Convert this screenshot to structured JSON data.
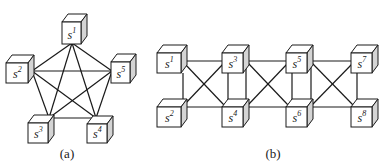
{
  "colors": {
    "stroke": "#1a1a1a",
    "side_face": "#d4d4d4",
    "background": "#ffffff"
  },
  "panels": [
    {
      "id": "a",
      "caption": "(a)",
      "caption_pos": [
        67,
        158
      ],
      "topology": "complete graph (K5)",
      "nodes": [
        {
          "id": "s1",
          "base": "s",
          "sup": "1",
          "x": 62,
          "y": 22,
          "w": 19,
          "h": 22,
          "anchor": [
            72,
            43
          ]
        },
        {
          "id": "s2",
          "base": "s",
          "sup": "2",
          "x": 6,
          "y": 63,
          "w": 22,
          "h": 20,
          "anchor": [
            32,
            71
          ]
        },
        {
          "id": "s5",
          "base": "s",
          "sup": "5",
          "x": 111,
          "y": 62,
          "w": 19,
          "h": 21,
          "anchor": [
            112,
            71
          ]
        },
        {
          "id": "s3",
          "base": "s",
          "sup": "3",
          "x": 28,
          "y": 123,
          "w": 20,
          "h": 20,
          "anchor": [
            49,
            118
          ]
        },
        {
          "id": "s4",
          "base": "s",
          "sup": "4",
          "x": 87,
          "y": 124,
          "w": 20,
          "h": 19,
          "anchor": [
            96,
            118
          ]
        }
      ],
      "edges": [
        [
          "s1",
          "s2"
        ],
        [
          "s1",
          "s3"
        ],
        [
          "s1",
          "s4"
        ],
        [
          "s1",
          "s5"
        ],
        [
          "s2",
          "s3"
        ],
        [
          "s2",
          "s4"
        ],
        [
          "s2",
          "s5"
        ],
        [
          "s3",
          "s4"
        ],
        [
          "s3",
          "s5"
        ],
        [
          "s4",
          "s5"
        ]
      ]
    },
    {
      "id": "b",
      "caption": "(b)",
      "caption_pos": [
        273,
        158
      ],
      "topology": "ladder with crossed rungs",
      "nodes": [
        {
          "id": "s1",
          "base": "s",
          "sup": "1",
          "x": 157,
          "y": 53,
          "w": 24,
          "h": 20
        },
        {
          "id": "s2",
          "base": "s",
          "sup": "2",
          "x": 157,
          "y": 107,
          "w": 24,
          "h": 20
        },
        {
          "id": "s3",
          "base": "s",
          "sup": "3",
          "x": 222,
          "y": 53,
          "w": 21,
          "h": 20
        },
        {
          "id": "s4",
          "base": "s",
          "sup": "4",
          "x": 222,
          "y": 107,
          "w": 21,
          "h": 20
        },
        {
          "id": "s5",
          "base": "s",
          "sup": "5",
          "x": 286,
          "y": 53,
          "w": 21,
          "h": 20
        },
        {
          "id": "s6",
          "base": "s",
          "sup": "6",
          "x": 286,
          "y": 107,
          "w": 21,
          "h": 20
        },
        {
          "id": "s7",
          "base": "s",
          "sup": "7",
          "x": 351,
          "y": 53,
          "w": 21,
          "h": 20
        },
        {
          "id": "s8",
          "base": "s",
          "sup": "8",
          "x": 351,
          "y": 107,
          "w": 21,
          "h": 20
        }
      ],
      "lines": [
        {
          "from": "s1",
          "to": "s3",
          "pts": [
            183,
            61,
            222,
            61
          ]
        },
        {
          "from": "s2",
          "to": "s4",
          "pts": [
            183,
            107,
            222,
            107
          ]
        },
        {
          "from": "s1",
          "to": "s4",
          "pts": [
            184,
            63,
            224,
            105
          ]
        },
        {
          "from": "s2",
          "to": "s3",
          "pts": [
            184,
            105,
            224,
            63
          ]
        },
        {
          "from": "s1",
          "to": "s2",
          "pts": [
            183,
            73,
            183,
            101
          ]
        },
        {
          "from": "s3",
          "to": "s5",
          "pts": [
            248,
            61,
            286,
            61
          ]
        },
        {
          "from": "s4",
          "to": "s6",
          "pts": [
            248,
            107,
            286,
            107
          ]
        },
        {
          "from": "s3",
          "to": "s6",
          "pts": [
            248,
            63,
            288,
            105
          ]
        },
        {
          "from": "s4",
          "to": "s5",
          "pts": [
            248,
            105,
            288,
            63
          ]
        },
        {
          "from": "s3",
          "to": "s4",
          "pts": [
            228,
            73,
            228,
            107
          ]
        },
        {
          "from": "s3",
          "to": "s4",
          "pts": [
            246,
            65,
            246,
            101
          ]
        },
        {
          "from": "s5",
          "to": "s7",
          "pts": [
            312,
            61,
            351,
            61
          ]
        },
        {
          "from": "s6",
          "to": "s8",
          "pts": [
            312,
            107,
            351,
            107
          ]
        },
        {
          "from": "s5",
          "to": "s8",
          "pts": [
            312,
            63,
            353,
            105
          ]
        },
        {
          "from": "s6",
          "to": "s7",
          "pts": [
            312,
            105,
            353,
            63
          ]
        },
        {
          "from": "s5",
          "to": "s6",
          "pts": [
            292,
            73,
            292,
            107
          ]
        },
        {
          "from": "s5",
          "to": "s6",
          "pts": [
            311,
            65,
            311,
            101
          ]
        },
        {
          "from": "s7",
          "to": "s8",
          "pts": [
            357,
            73,
            357,
            107
          ]
        }
      ]
    }
  ],
  "cube_depth": {
    "dx": 6,
    "dy": -8
  }
}
